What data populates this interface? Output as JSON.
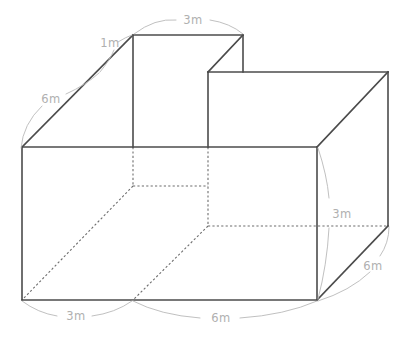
{
  "figure": {
    "unit": "m",
    "line_colors": {
      "visible_edge": "#4b4b4b",
      "hidden_edge": "#6d6d6d",
      "leader_arc": "#b9b9b9",
      "dimension_text": "#b0b0b0",
      "background": "#ffffff"
    },
    "dimensions": [
      {
        "id": "top-depth",
        "label": "3m",
        "value": 3,
        "position": "top-edge"
      },
      {
        "id": "step-rise",
        "label": "1m",
        "value": 1,
        "position": "upper-left-diagonal"
      },
      {
        "id": "left-diagonal",
        "label": "6m",
        "value": 6,
        "position": "left-diagonal"
      },
      {
        "id": "right-height",
        "label": "3m",
        "value": 3,
        "position": "right-vertical"
      },
      {
        "id": "right-diagonal",
        "label": "6m",
        "value": 6,
        "position": "lower-right-diagonal"
      },
      {
        "id": "bottom-left-width",
        "label": "3m",
        "value": 3,
        "position": "bottom-edge-left"
      },
      {
        "id": "bottom-right-width",
        "label": "6m",
        "value": 6,
        "position": "bottom-edge-right"
      }
    ],
    "labels": {
      "top_depth": "3m",
      "step_rise": "1m",
      "left_diagonal": "6m",
      "right_height": "3m",
      "right_diagonal": "6m",
      "bottom_left": "3m",
      "bottom_right": "6m"
    }
  }
}
